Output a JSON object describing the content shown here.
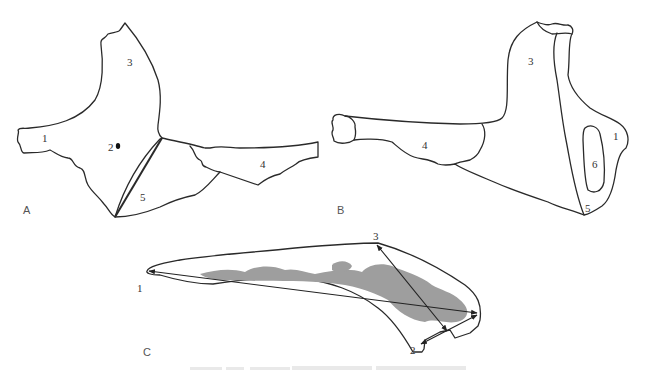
{
  "figure": {
    "panels": [
      {
        "id": "A",
        "label": "A",
        "region_labels": [
          "1",
          "2",
          "3",
          "4",
          "5"
        ]
      },
      {
        "id": "B",
        "label": "B",
        "region_labels": [
          "1",
          "3",
          "4",
          "5",
          "6"
        ]
      },
      {
        "id": "C",
        "label": "C",
        "point_labels": [
          "1",
          "2",
          "3"
        ],
        "measurements": [
          {
            "from": "1",
            "to": "posterior tip",
            "type": "double-arrow"
          },
          {
            "from": "3",
            "to": "2",
            "type": "double-arrow"
          },
          {
            "from": "2",
            "to": "posterior tip",
            "type": "double-arrow"
          }
        ]
      }
    ],
    "caption": {
      "visible": true,
      "legible": false
    },
    "colors": {
      "outline": "#2a2a2a",
      "cancellous_fill": "#d9d9d9",
      "marrow_fill": "#9a9a9a",
      "label_text": "#333333"
    }
  },
  "labels": {
    "A": {
      "panel": "A",
      "r1": "1",
      "r2": "2",
      "r3": "3",
      "r4": "4",
      "r5": "5"
    },
    "B": {
      "panel": "B",
      "r1": "1",
      "r3": "3",
      "r4": "4",
      "r5": "5",
      "r6": "6"
    },
    "C": {
      "panel": "C",
      "p1": "1",
      "p2": "2",
      "p3": "3"
    }
  }
}
